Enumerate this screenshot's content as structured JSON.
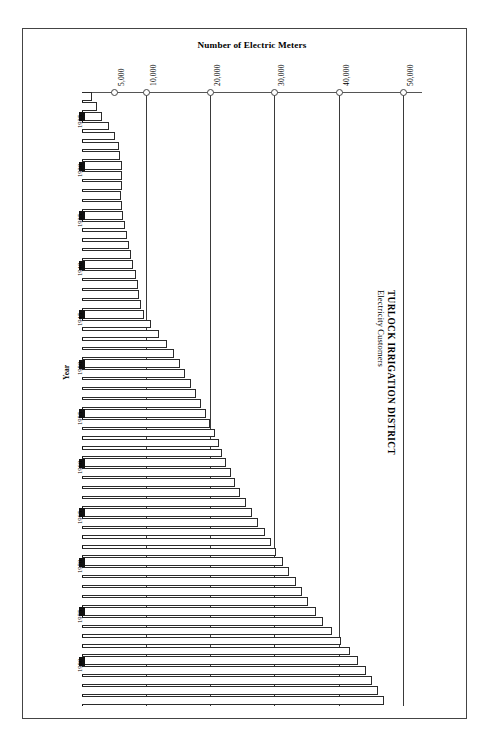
{
  "chart_data": {
    "type": "bar",
    "orientation": "horizontal",
    "title": "TURLOCK IRRIGATION DISTRICT",
    "subtitle": "Electricity Customers",
    "xlabel": "Number of Electric Meters",
    "ylabel": "Year",
    "xlim": [
      0,
      53000
    ],
    "ylim_categories": "1923-1984",
    "grid": true,
    "legend": "none",
    "xticks": [
      5000,
      10000,
      20000,
      30000,
      40000,
      50000
    ],
    "xtick_labels": [
      "5,000",
      "10,000",
      "20,000",
      "30,000",
      "40,000",
      "50,000"
    ],
    "ytick_labels": [
      "1925",
      "1930",
      "1935",
      "1940",
      "1945",
      "1950",
      "1955",
      "1960",
      "1965",
      "1970",
      "1975",
      "1980"
    ],
    "categories": [
      "1923",
      "1924",
      "1925",
      "1926",
      "1927",
      "1928",
      "1929",
      "1930",
      "1931",
      "1932",
      "1933",
      "1934",
      "1935",
      "1936",
      "1937",
      "1938",
      "1939",
      "1940",
      "1941",
      "1942",
      "1943",
      "1944",
      "1945",
      "1946",
      "1947",
      "1948",
      "1949",
      "1950",
      "1951",
      "1952",
      "1953",
      "1954",
      "1955",
      "1956",
      "1957",
      "1958",
      "1959",
      "1960",
      "1961",
      "1962",
      "1963",
      "1964",
      "1965",
      "1966",
      "1967",
      "1968",
      "1969",
      "1970",
      "1971",
      "1972",
      "1973",
      "1974",
      "1975",
      "1976",
      "1977",
      "1978",
      "1979",
      "1980",
      "1981",
      "1982",
      "1983",
      "1984"
    ],
    "values": [
      1600,
      2300,
      3100,
      4200,
      5100,
      5700,
      6000,
      6300,
      6300,
      6200,
      6100,
      6200,
      6400,
      6700,
      7000,
      7300,
      7600,
      8000,
      8400,
      8700,
      8900,
      9200,
      9700,
      10800,
      12000,
      13200,
      14300,
      15200,
      16100,
      17000,
      17800,
      18600,
      19300,
      20000,
      20700,
      21300,
      21900,
      22500,
      23200,
      23900,
      24700,
      25600,
      26500,
      27500,
      28500,
      29400,
      30300,
      31300,
      32300,
      33300,
      34300,
      35300,
      36400,
      37600,
      38900,
      40300,
      41700,
      43000,
      44200,
      45200,
      46100,
      47000
    ]
  },
  "labels": {
    "xaxis_title": "Number of Electric Meters",
    "yaxis_title": "Year",
    "title_main": "TURLOCK IRRIGATION DISTRICT",
    "title_sub": "Electricity Customers"
  },
  "colors": {
    "bar_fill": "#ffffff",
    "bar_stroke": "#2b2b2b",
    "grid": "#3a3a3a",
    "frame": "#444444",
    "text": "#000000"
  }
}
